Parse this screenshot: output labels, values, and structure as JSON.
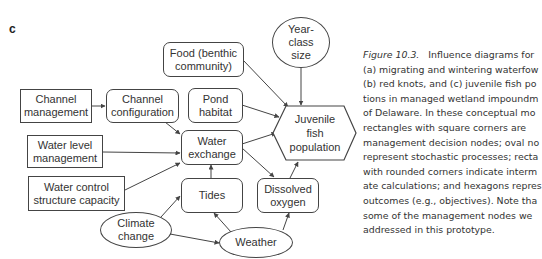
{
  "panel_label": "c",
  "nodes": {
    "food": {
      "line1": "Food (benthic",
      "line2": "community)",
      "type": "rounded"
    },
    "year_class": {
      "line1": "Year-",
      "line2": "class",
      "line3": "size",
      "type": "oval"
    },
    "channel_management": {
      "line1": "Channel",
      "line2": "management",
      "type": "square"
    },
    "channel_configuration": {
      "line1": "Channel",
      "line2": "configuration",
      "type": "rounded"
    },
    "pond_habitat": {
      "line1": "Pond",
      "line2": "habitat",
      "type": "rounded"
    },
    "juvenile_fish": {
      "line1": "Juvenile",
      "line2": "fish",
      "line3": "population",
      "type": "hexagon"
    },
    "water_level_management": {
      "line1": "Water level",
      "line2": "management",
      "type": "square"
    },
    "water_exchange": {
      "line1": "Water",
      "line2": "exchange",
      "type": "rounded"
    },
    "water_control": {
      "line1": "Water control",
      "line2": "structure capacity",
      "type": "square"
    },
    "tides": {
      "line1": "Tides",
      "type": "rounded"
    },
    "dissolved_oxygen": {
      "line1": "Dissolved",
      "line2": "oxygen",
      "type": "rounded"
    },
    "climate_change": {
      "line1": "Climate",
      "line2": "change",
      "type": "oval"
    },
    "weather": {
      "line1": "Weather",
      "type": "oval"
    }
  },
  "edges": [
    [
      "channel_management",
      "channel_configuration"
    ],
    [
      "channel_configuration",
      "water_exchange"
    ],
    [
      "water_level_management",
      "water_exchange"
    ],
    [
      "water_control",
      "water_exchange"
    ],
    [
      "tides",
      "water_exchange"
    ],
    [
      "food",
      "juvenile_fish"
    ],
    [
      "pond_habitat",
      "juvenile_fish"
    ],
    [
      "year_class",
      "juvenile_fish"
    ],
    [
      "water_exchange",
      "juvenile_fish"
    ],
    [
      "water_exchange",
      "dissolved_oxygen"
    ],
    [
      "dissolved_oxygen",
      "juvenile_fish"
    ],
    [
      "climate_change",
      "tides"
    ],
    [
      "climate_change",
      "weather"
    ],
    [
      "weather",
      "tides"
    ],
    [
      "weather",
      "dissolved_oxygen"
    ]
  ],
  "caption": {
    "figure_label": "Figure 10.3.",
    "lines": [
      "Influence diagrams for",
      "(a) migrating and wintering waterfow",
      "(b) red knots, and (c) juvenile fish po",
      "tions in managed wetland impoundm",
      "of Delaware. In these conceptual mo",
      "rectangles with square corners are",
      "management decision nodes; oval no",
      "represent stochastic processes; recta",
      "with rounded corners indicate interm",
      "ate calculations; and hexagons repres",
      "outcomes (e.g., objectives). Note tha",
      "some of the management nodes we",
      "addressed in this prototype."
    ]
  }
}
